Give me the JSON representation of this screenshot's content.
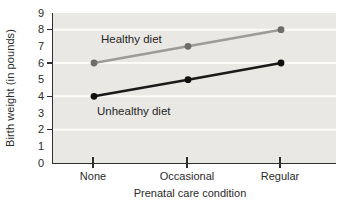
{
  "figure": {
    "background": "#ffffff",
    "plot_background": "#e9e8e4",
    "gridline_color": "#fbfbf9",
    "axis_color": "#2f2f2f",
    "text_color": "#2b2b2b"
  },
  "chart_data": {
    "type": "line",
    "title": "",
    "categories": [
      "None",
      "Occasional",
      "Regular"
    ],
    "series": [
      {
        "name": "Healthy diet",
        "values": [
          6,
          7,
          8
        ],
        "line_color": "#9b9b99",
        "point_color": "#6c6c6a"
      },
      {
        "name": "Unhealthy diet",
        "values": [
          4,
          5,
          6
        ],
        "line_color": "#1a1a1a",
        "point_color": "#111111"
      }
    ],
    "xlabel": "Prenatal care condition",
    "ylabel": "Birth weight (in pounds)",
    "ylim": [
      0,
      9
    ],
    "y_tick_labels": [
      "0",
      "1",
      "2",
      "3",
      "4",
      "5",
      "6",
      "7",
      "8",
      "9"
    ],
    "y_major_tick_values": [
      2,
      4,
      6,
      8
    ],
    "gridline_values": [
      2,
      4,
      6,
      8
    ],
    "grid": "horizontal white lines on shaded plot area",
    "legend": "inline labels next to lines"
  }
}
